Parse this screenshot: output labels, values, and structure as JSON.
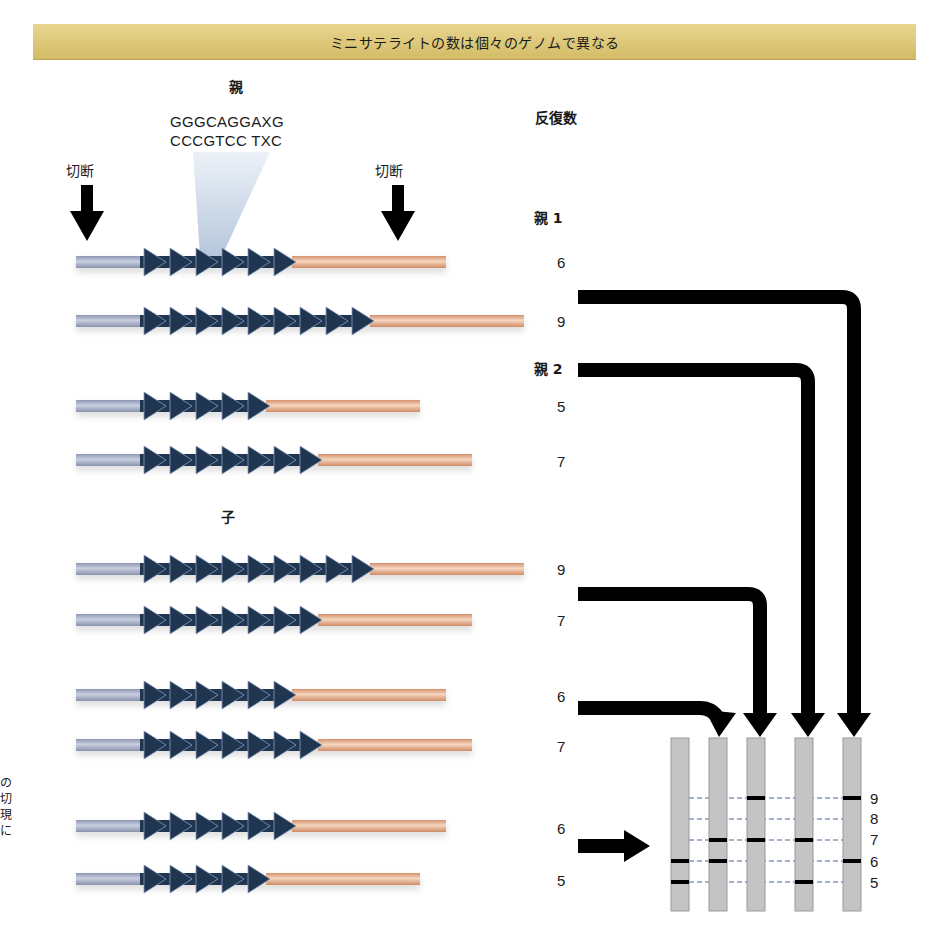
{
  "banner": {
    "title": "ミニサテライトの数は個々のゲノムで異なる"
  },
  "labels": {
    "parent_header": "親",
    "sequence_line1": "GGGCAGGAXG",
    "sequence_line2": "CCCGTCC TXC",
    "cut_left": "切断",
    "cut_right": "切断",
    "repeat_count_header": "反復数",
    "parent1": "親 1",
    "parent2": "親 2",
    "child_header": "子"
  },
  "side_text": [
    "の",
    "切",
    "現",
    "に"
  ],
  "strands": [
    {
      "group": "parent1",
      "repeats": 6,
      "label": "6"
    },
    {
      "group": "parent1",
      "repeats": 9,
      "label": "9"
    },
    {
      "group": "parent2",
      "repeats": 5,
      "label": "5"
    },
    {
      "group": "parent2",
      "repeats": 7,
      "label": "7"
    },
    {
      "group": "child1",
      "repeats": 9,
      "label": "9"
    },
    {
      "group": "child1",
      "repeats": 7,
      "label": "7"
    },
    {
      "group": "child2",
      "repeats": 6,
      "label": "6"
    },
    {
      "group": "child2",
      "repeats": 7,
      "label": "7"
    },
    {
      "group": "child3",
      "repeats": 6,
      "label": "6"
    },
    {
      "group": "child3",
      "repeats": 5,
      "label": "5"
    }
  ],
  "gel": {
    "scale_labels": [
      "9",
      "8",
      "7",
      "6",
      "5"
    ],
    "lanes": [
      {
        "source": "child3",
        "bands": [
          6,
          5
        ]
      },
      {
        "source": "child2",
        "bands": [
          7,
          6
        ]
      },
      {
        "source": "child1",
        "bands": [
          9,
          7
        ]
      },
      {
        "source": "parent2",
        "bands": [
          7,
          5
        ]
      },
      {
        "source": "parent1",
        "bands": [
          9,
          6
        ]
      }
    ]
  },
  "colors": {
    "banner": "#dcc677",
    "repeat_arrow": "#1f3550",
    "left_segment": "#a9b1c8",
    "right_segment": "#e2a886",
    "gel_lane": "#c4c4c4",
    "gel_guide": "#9fb3cc",
    "arrow": "#000000"
  }
}
